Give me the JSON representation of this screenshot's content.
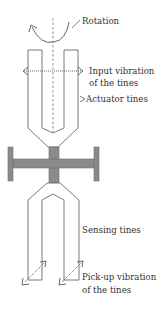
{
  "colors": {
    "line": "#6a6a6a",
    "body_fill": "#8a8a8a",
    "body_stroke": "#6e6e6e",
    "text": "#333333",
    "background": "#ffffff"
  },
  "labels": {
    "rotation": "Rotation",
    "input_vibration_line1": "Input vibration",
    "input_vibration_line2": "of the tines",
    "actuator_tines": "Actuator tines",
    "sensing_tines": "Sensing tines",
    "pickup_vibration_line1": "Pick-up vibration",
    "pickup_vibration_line2": "of the tines"
  },
  "components": {
    "rotation_arrow": "curved-arrow",
    "center_axis": "dashed-line",
    "input_vibration_arrow": "dotted-double-arrow-horizontal",
    "actuator_tines": "u-shaped-tines-top",
    "base_body": "h-shaped-mount",
    "sensing_tines": "u-shaped-tines-bottom",
    "pickup_vibration_arrows": "dotted-double-arrows-diagonal"
  }
}
